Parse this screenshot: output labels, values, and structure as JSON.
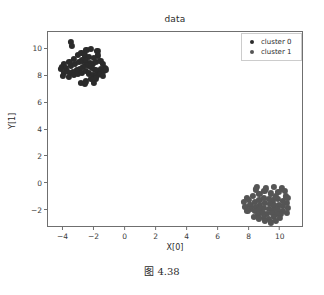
{
  "caption": "图 4.38",
  "legend": {
    "position": "upper-right",
    "entries": [
      {
        "label": "cluster 0",
        "color": "#2b2b2b",
        "marker": "circle-marker"
      },
      {
        "label": "cluster 1",
        "color": "#555555",
        "marker": "circle-marker"
      }
    ]
  },
  "chart_data": {
    "type": "scatter",
    "title": "data",
    "xlabel": "X[0]",
    "ylabel": "Y[1]",
    "xlim": [
      -5.0,
      11.5
    ],
    "ylim": [
      -3.3,
      11.3
    ],
    "xticks": [
      -4,
      -2,
      0,
      2,
      4,
      6,
      8,
      10
    ],
    "xticklabels": [
      "−4",
      "−2",
      "0",
      "2",
      "4",
      "6",
      "8",
      "10"
    ],
    "yticks": [
      -2,
      0,
      2,
      4,
      6,
      8,
      10
    ],
    "yticklabels": [
      "−2",
      "0",
      "2",
      "4",
      "6",
      "8",
      "10"
    ],
    "grid": false,
    "marker_size": 3.1,
    "series": [
      {
        "name": "cluster 0",
        "color": "#2b2b2b",
        "n_points": 60,
        "center": [
          -2.75,
          8.85
        ],
        "points": [
          [
            -3.52,
            10.55
          ],
          [
            -3.48,
            10.25
          ],
          [
            -2.52,
            9.95
          ],
          [
            -2.22,
            10.05
          ],
          [
            -1.82,
            9.92
          ],
          [
            -1.78,
            9.55
          ],
          [
            -3.05,
            9.62
          ],
          [
            -2.85,
            9.72
          ],
          [
            -2.62,
            9.55
          ],
          [
            -2.38,
            9.45
          ],
          [
            -2.05,
            9.35
          ],
          [
            -3.32,
            9.28
          ],
          [
            -3.62,
            9.05
          ],
          [
            -3.95,
            8.95
          ],
          [
            -4.12,
            8.72
          ],
          [
            -4.18,
            8.55
          ],
          [
            -3.85,
            8.62
          ],
          [
            -3.55,
            8.78
          ],
          [
            -3.25,
            8.92
          ],
          [
            -3.02,
            9.05
          ],
          [
            -2.78,
            9.18
          ],
          [
            -2.55,
            9.12
          ],
          [
            -2.32,
            9.02
          ],
          [
            -2.12,
            8.92
          ],
          [
            -1.92,
            9.05
          ],
          [
            -1.62,
            9.15
          ],
          [
            -1.45,
            8.95
          ],
          [
            -1.35,
            8.62
          ],
          [
            -1.58,
            8.52
          ],
          [
            -1.75,
            8.35
          ],
          [
            -1.95,
            8.48
          ],
          [
            -2.15,
            8.62
          ],
          [
            -2.35,
            8.75
          ],
          [
            -2.55,
            8.82
          ],
          [
            -2.75,
            8.68
          ],
          [
            -2.95,
            8.55
          ],
          [
            -3.15,
            8.45
          ],
          [
            -3.38,
            8.35
          ],
          [
            -3.58,
            8.25
          ],
          [
            -3.78,
            8.42
          ],
          [
            -3.95,
            8.28
          ],
          [
            -4.05,
            8.05
          ],
          [
            -3.65,
            7.98
          ],
          [
            -3.35,
            8.08
          ],
          [
            -3.05,
            8.18
          ],
          [
            -2.82,
            8.28
          ],
          [
            -2.58,
            8.38
          ],
          [
            -2.35,
            8.22
          ],
          [
            -2.12,
            8.12
          ],
          [
            -1.88,
            8.05
          ],
          [
            -1.65,
            8.18
          ],
          [
            -1.48,
            8.05
          ],
          [
            -1.92,
            7.85
          ],
          [
            -2.25,
            7.78
          ],
          [
            -2.55,
            7.62
          ],
          [
            -2.88,
            7.48
          ],
          [
            -2.62,
            7.45
          ],
          [
            -2.05,
            7.52
          ],
          [
            -1.38,
            8.38
          ],
          [
            -1.28,
            8.52
          ]
        ]
      },
      {
        "name": "cluster 1",
        "color": "#555555",
        "n_points": 60,
        "center": [
          9.15,
          -1.62
        ],
        "points": [
          [
            8.45,
            -0.25
          ],
          [
            8.38,
            -0.42
          ],
          [
            9.55,
            -0.22
          ],
          [
            10.05,
            -0.35
          ],
          [
            10.28,
            -0.55
          ],
          [
            9.85,
            -0.62
          ],
          [
            9.35,
            -0.72
          ],
          [
            8.95,
            -0.55
          ],
          [
            8.62,
            -0.75
          ],
          [
            8.22,
            -0.88
          ],
          [
            7.82,
            -1.05
          ],
          [
            7.62,
            -1.35
          ],
          [
            7.72,
            -1.72
          ],
          [
            8.05,
            -1.55
          ],
          [
            8.35,
            -1.35
          ],
          [
            8.62,
            -1.18
          ],
          [
            8.92,
            -1.05
          ],
          [
            9.22,
            -1.12
          ],
          [
            9.52,
            -1.25
          ],
          [
            9.82,
            -1.15
          ],
          [
            10.12,
            -1.28
          ],
          [
            10.42,
            -1.42
          ],
          [
            10.45,
            -1.78
          ],
          [
            10.15,
            -1.65
          ],
          [
            9.88,
            -1.55
          ],
          [
            9.58,
            -1.62
          ],
          [
            9.28,
            -1.52
          ],
          [
            8.98,
            -1.45
          ],
          [
            8.68,
            -1.58
          ],
          [
            8.38,
            -1.72
          ],
          [
            8.08,
            -1.88
          ],
          [
            8.32,
            -2.02
          ],
          [
            8.62,
            -1.95
          ],
          [
            8.92,
            -1.82
          ],
          [
            9.22,
            -1.88
          ],
          [
            9.52,
            -1.98
          ],
          [
            9.82,
            -1.92
          ],
          [
            10.12,
            -2.05
          ],
          [
            10.38,
            -2.18
          ],
          [
            10.02,
            -2.28
          ],
          [
            9.72,
            -2.22
          ],
          [
            9.42,
            -2.15
          ],
          [
            9.12,
            -2.25
          ],
          [
            8.82,
            -2.18
          ],
          [
            8.52,
            -2.32
          ],
          [
            8.25,
            -2.45
          ],
          [
            8.58,
            -2.58
          ],
          [
            8.92,
            -2.52
          ],
          [
            9.25,
            -2.62
          ],
          [
            9.58,
            -2.48
          ],
          [
            9.95,
            -2.55
          ],
          [
            9.68,
            -2.78
          ],
          [
            9.35,
            -2.88
          ],
          [
            8.98,
            -2.75
          ],
          [
            7.95,
            -1.22
          ],
          [
            10.32,
            -0.95
          ],
          [
            9.05,
            -0.35
          ],
          [
            10.48,
            -1.05
          ],
          [
            7.85,
            -2.05
          ],
          [
            9.68,
            -0.95
          ]
        ]
      }
    ]
  }
}
